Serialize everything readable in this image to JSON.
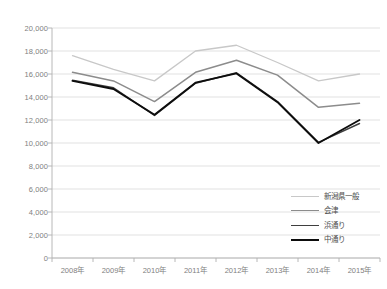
{
  "chart_data": {
    "type": "line",
    "title": "",
    "xlabel": "",
    "ylabel": "",
    "ylim": [
      0,
      20000
    ],
    "ytick_step": 2000,
    "grid": true,
    "legend_position": "inside-bottom-right",
    "categories": [
      "2008年",
      "2009年",
      "2010年",
      "2011年",
      "2012年",
      "2013年",
      "2014年",
      "2015年"
    ],
    "ytick_labels": [
      "20,000",
      "18,000",
      "16,000",
      "14,000",
      "12,000",
      "10,000",
      "8,000",
      "6,000",
      "4,000",
      "2,000",
      "0"
    ],
    "ytick_values": [
      20000,
      18000,
      16000,
      14000,
      12000,
      10000,
      8000,
      6000,
      4000,
      2000,
      0
    ],
    "series": [
      {
        "name": "新潟県一般",
        "color": "#c8c8c8",
        "width": 1.3,
        "values": [
          17600,
          16400,
          15400,
          18000,
          18500,
          17000,
          15400,
          16000
        ]
      },
      {
        "name": "会津",
        "color": "#8c8c8c",
        "width": 1.5,
        "values": [
          16150,
          15400,
          13600,
          16150,
          17200,
          15900,
          13100,
          13450
        ]
      },
      {
        "name": "浜通り",
        "color": "#3f3f3f",
        "width": 1.5,
        "values": [
          15450,
          14800,
          12400,
          15200,
          16100,
          13600,
          10050,
          11700
        ]
      },
      {
        "name": "中通り",
        "color": "#0d0d0d",
        "width": 1.9,
        "values": [
          15400,
          14700,
          12450,
          15250,
          16050,
          13550,
          10000,
          12000
        ]
      }
    ]
  },
  "axis": {
    "tick_color": "#b0b0b0",
    "grid_color": "#d9d9d9",
    "label_color": "#808080"
  },
  "legend": {
    "entries": [
      {
        "label": "新潟県一般",
        "color": "#c8c8c8",
        "width": 1.3
      },
      {
        "label": "会津",
        "color": "#8c8c8c",
        "width": 1.6
      },
      {
        "label": "浜通り",
        "color": "#3f3f3f",
        "width": 1.8
      },
      {
        "label": "中通り",
        "color": "#0d0d0d",
        "width": 2.2
      }
    ]
  }
}
